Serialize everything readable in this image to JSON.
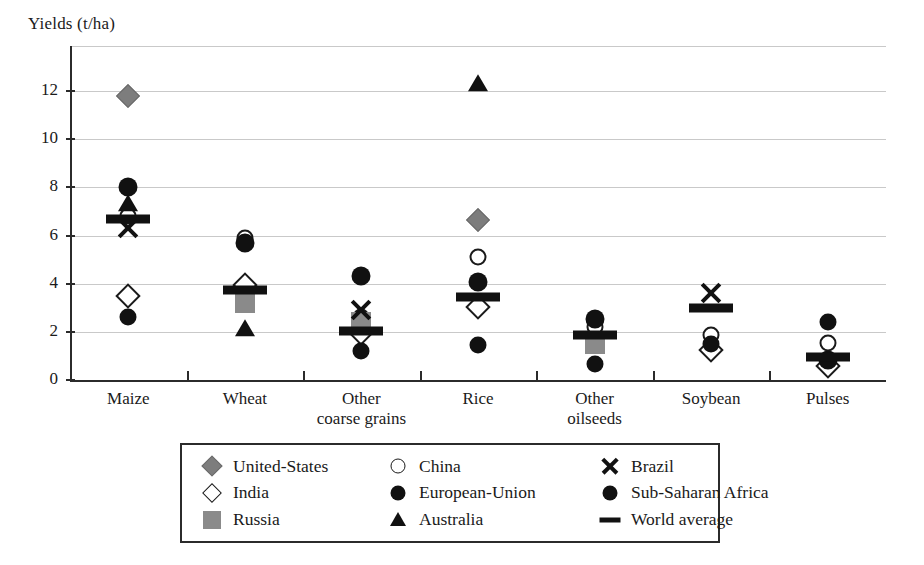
{
  "chart_data": {
    "type": "scatter",
    "title": "",
    "ylabel": "Yields (t/ha)",
    "xlabel": "",
    "ylim": [
      0,
      13
    ],
    "yticks": [
      0,
      2,
      4,
      6,
      8,
      10,
      12
    ],
    "ytick_labels": [
      "0",
      "2",
      "4",
      "6",
      "8",
      "10",
      "12"
    ],
    "grid": true,
    "grid_axis": "y",
    "legend_position": "bottom",
    "categories": [
      "Maize",
      "Wheat",
      "Other\ncoarse grains",
      "Rice",
      "Other\noilseeds",
      "Soybean",
      "Pulses"
    ],
    "category_labels": [
      [
        "Maize"
      ],
      [
        "Wheat"
      ],
      [
        "Other",
        "coarse grains"
      ],
      [
        "Rice"
      ],
      [
        "Other",
        "oilseeds"
      ],
      [
        "Soybean"
      ],
      [
        "Pulses"
      ]
    ],
    "series": [
      {
        "name": "United-States",
        "marker": "diamond-filled",
        "color": "#7d7d7d",
        "values": [
          11.8,
          null,
          null,
          6.65,
          null,
          null,
          null
        ]
      },
      {
        "name": "India",
        "marker": "diamond-open",
        "color": "#ffffff",
        "values": [
          3.5,
          3.95,
          1.95,
          3.05,
          null,
          1.25,
          0.6
        ]
      },
      {
        "name": "Russia",
        "marker": "square-filled",
        "color": "#8a8a8a",
        "values": [
          null,
          3.2,
          2.4,
          null,
          1.5,
          null,
          null
        ]
      },
      {
        "name": "China",
        "marker": "circle-open",
        "color": "#ffffff",
        "values": [
          6.8,
          5.9,
          2.6,
          5.1,
          2.2,
          1.85,
          1.55
        ]
      },
      {
        "name": "European-Union",
        "marker": "circle-filled",
        "color": "#111111",
        "values": [
          8.0,
          5.7,
          4.3,
          4.05,
          2.55,
          null,
          0.85
        ]
      },
      {
        "name": "Australia",
        "marker": "triangle-filled",
        "color": "#111111",
        "values": [
          7.3,
          2.1,
          null,
          12.3,
          null,
          null,
          null
        ]
      },
      {
        "name": "Brazil",
        "marker": "cross",
        "color": "#111111",
        "values": [
          6.3,
          null,
          2.9,
          null,
          null,
          3.6,
          null
        ]
      },
      {
        "name": "Sub-Saharan Africa",
        "marker": "circle-filled-sm",
        "color": "#111111",
        "values": [
          2.6,
          null,
          1.2,
          1.45,
          0.65,
          1.5,
          2.4
        ]
      },
      {
        "name": "World average",
        "marker": "bar",
        "color": "#111111",
        "values": [
          6.7,
          3.75,
          2.05,
          3.45,
          1.85,
          3.0,
          0.95
        ]
      }
    ]
  },
  "legend": {
    "items": [
      {
        "label": "United-States",
        "marker": "diamond-filled"
      },
      {
        "label": "China",
        "marker": "circle-open"
      },
      {
        "label": "Brazil",
        "marker": "cross"
      },
      {
        "label": "India",
        "marker": "diamond-open"
      },
      {
        "label": "European-Union",
        "marker": "circle-filled"
      },
      {
        "label": "Sub-Saharan Africa",
        "marker": "circle-filled-sm"
      },
      {
        "label": "Russia",
        "marker": "square-filled"
      },
      {
        "label": "Australia",
        "marker": "triangle-filled"
      },
      {
        "label": "World average",
        "marker": "bar"
      }
    ]
  }
}
